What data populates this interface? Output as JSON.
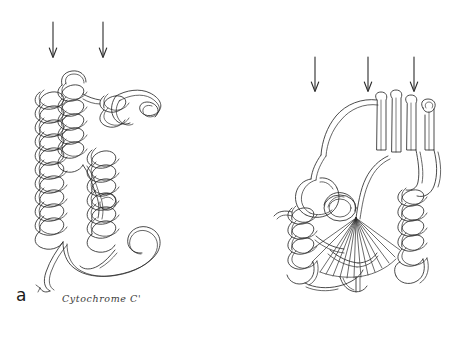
{
  "figure": {
    "background_color": "#ffffff",
    "ink_color": "#2b2b2b",
    "style": "hand-drawn protein ribbon schematic",
    "width": 456,
    "height": 339
  },
  "panels": [
    {
      "id": "a",
      "letter": "a",
      "caption": "Cytochrome C'",
      "fold": "four-helix bundle",
      "arrow_count": 2,
      "arrows": [
        {
          "x": 53,
          "y_top": 22,
          "y_bottom": 58,
          "direction": "down"
        },
        {
          "x": 103,
          "y_top": 22,
          "y_bottom": 58,
          "direction": "down"
        }
      ]
    },
    {
      "id": "b",
      "letter": "b",
      "caption": "Phosphoglycerate Kinase domain 2",
      "fold": "mixed alpha/beta domain with parallel beta sheet",
      "arrow_count": 3,
      "arrows": [
        {
          "x": 315,
          "y_top": 57,
          "y_bottom": 92,
          "direction": "down"
        },
        {
          "x": 368,
          "y_top": 57,
          "y_bottom": 92,
          "direction": "down"
        },
        {
          "x": 414,
          "y_top": 57,
          "y_bottom": 92,
          "direction": "down"
        }
      ]
    }
  ],
  "icons": {
    "arrow": "down-arrow-icon"
  }
}
